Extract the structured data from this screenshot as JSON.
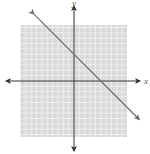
{
  "chart_data": {
    "type": "line",
    "title": "",
    "xlabel": "x",
    "ylabel": "y",
    "xlim": [
      -10,
      10
    ],
    "ylim": [
      -10,
      10
    ],
    "grid": true,
    "series": [
      {
        "name": "y = -x + 5",
        "slope": -1,
        "intercept": 5,
        "x": [
          -6,
          12
        ],
        "y": [
          11,
          -7
        ]
      }
    ],
    "colors": {
      "grid_bg": "#d9d9d9",
      "grid_lines": "#f2f2f2",
      "axes": "#333333",
      "line": "#6e6e6e"
    }
  },
  "axes": {
    "x_label": "x",
    "y_label": "y"
  }
}
